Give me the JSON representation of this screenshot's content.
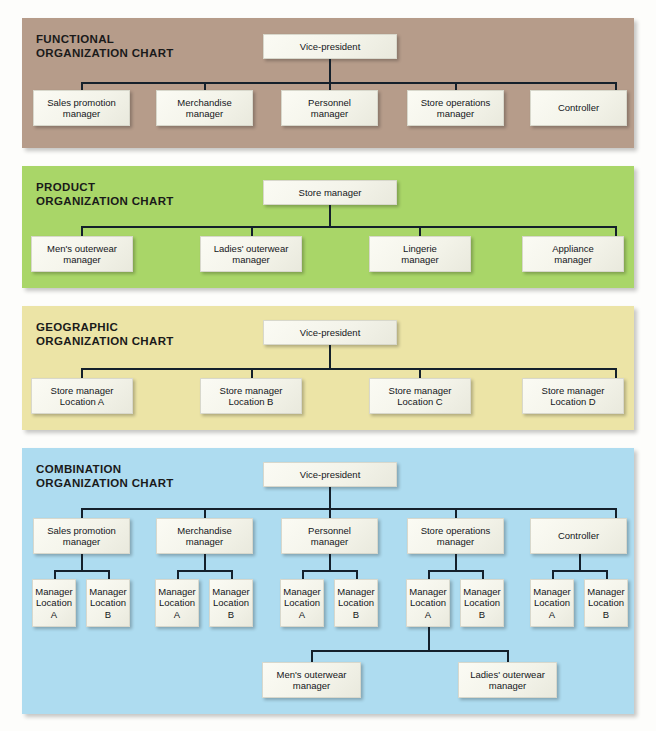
{
  "figure": {
    "type": "organization-charts",
    "panel_count": 4
  },
  "panels": [
    {
      "id": "functional",
      "title_line1": "FUNCTIONAL",
      "title_line2": "ORGANIZATION CHART",
      "background_color": "#b69c8a",
      "root": "Vice-president",
      "children": [
        "Sales promotion manager",
        "Merchandise manager",
        "Personnel manager",
        "Store operations manager",
        "Controller"
      ],
      "nodes": {
        "root": {
          "l1": "Vice-president",
          "l2": ""
        },
        "c0": {
          "l1": "Sales promotion",
          "l2": "manager"
        },
        "c1": {
          "l1": "Merchandise",
          "l2": "manager"
        },
        "c2": {
          "l1": "Personnel",
          "l2": "manager"
        },
        "c3": {
          "l1": "Store operations",
          "l2": "manager"
        },
        "c4": {
          "l1": "Controller",
          "l2": ""
        }
      }
    },
    {
      "id": "product",
      "title_line1": "PRODUCT",
      "title_line2": "ORGANIZATION CHART",
      "background_color": "#a9d668",
      "root": "Store manager",
      "children": [
        "Men's outerwear manager",
        "Ladies' outerwear manager",
        "Lingerie manager",
        "Appliance manager"
      ],
      "nodes": {
        "root": {
          "l1": "Store manager",
          "l2": ""
        },
        "c0": {
          "l1": "Men's outerwear",
          "l2": "manager"
        },
        "c1": {
          "l1": "Ladies' outerwear",
          "l2": "manager"
        },
        "c2": {
          "l1": "Lingerie",
          "l2": "manager"
        },
        "c3": {
          "l1": "Appliance",
          "l2": "manager"
        }
      }
    },
    {
      "id": "geographic",
      "title_line1": "GEOGRAPHIC",
      "title_line2": "ORGANIZATION CHART",
      "background_color": "#ece4a6",
      "root": "Vice-president",
      "children": [
        "Store manager Location A",
        "Store manager Location B",
        "Store manager Location C",
        "Store manager Location D"
      ],
      "nodes": {
        "root": {
          "l1": "Vice-president",
          "l2": ""
        },
        "c0": {
          "l1": "Store manager",
          "l2": "Location A"
        },
        "c1": {
          "l1": "Store manager",
          "l2": "Location B"
        },
        "c2": {
          "l1": "Store manager",
          "l2": "Location C"
        },
        "c3": {
          "l1": "Store manager",
          "l2": "Location D"
        }
      }
    },
    {
      "id": "combination",
      "title_line1": "COMBINATION",
      "title_line2": "ORGANIZATION CHART",
      "background_color": "#aedcf0",
      "root": "Vice-president",
      "children": [
        "Sales promotion manager",
        "Merchandise manager",
        "Personnel manager",
        "Store operations manager",
        "Controller"
      ],
      "grandchildren_pattern": [
        "Manager Location A",
        "Manager Location B"
      ],
      "great_grandchildren": [
        "Men's outerwear manager",
        "Ladies' outerwear manager"
      ],
      "nodes": {
        "root": {
          "l1": "Vice-president",
          "l2": ""
        },
        "c0": {
          "l1": "Sales promotion",
          "l2": "manager"
        },
        "c1": {
          "l1": "Merchandise",
          "l2": "manager"
        },
        "c2": {
          "l1": "Personnel",
          "l2": "manager"
        },
        "c3": {
          "l1": "Store operations",
          "l2": "manager"
        },
        "c4": {
          "l1": "Controller",
          "l2": ""
        },
        "g0a": {
          "l1": "Manager",
          "l2": "Location",
          "l3": "A"
        },
        "g0b": {
          "l1": "Manager",
          "l2": "Location",
          "l3": "B"
        },
        "g1a": {
          "l1": "Manager",
          "l2": "Location",
          "l3": "A"
        },
        "g1b": {
          "l1": "Manager",
          "l2": "Location",
          "l3": "B"
        },
        "g2a": {
          "l1": "Manager",
          "l2": "Location",
          "l3": "A"
        },
        "g2b": {
          "l1": "Manager",
          "l2": "Location",
          "l3": "B"
        },
        "g3a": {
          "l1": "Manager",
          "l2": "Location",
          "l3": "A"
        },
        "g3b": {
          "l1": "Manager",
          "l2": "Location",
          "l3": "B"
        },
        "g4a": {
          "l1": "Manager",
          "l2": "Location",
          "l3": "A"
        },
        "g4b": {
          "l1": "Manager",
          "l2": "Location",
          "l3": "B"
        },
        "gg0": {
          "l1": "Men's outerwear",
          "l2": "manager"
        },
        "gg1": {
          "l1": "Ladies' outerwear",
          "l2": "manager"
        }
      }
    }
  ]
}
